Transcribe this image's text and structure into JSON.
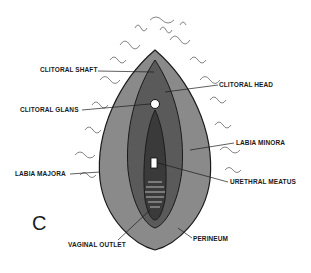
{
  "panel": "C",
  "labels": {
    "clitoral_shaft": "CLITORAL SHAFT",
    "clitoral_head": "CLITORAL HEAD",
    "clitoral_glans": "CLITORAL GLANS",
    "labia_minora": "LABIA MINORA",
    "labia_majora": "LABIA MAJORA",
    "urethral_meatus": "URETHRAL MEATUS",
    "vaginal_outlet": "VAGINAL OUTLET",
    "perineum": "PERINEUM"
  },
  "colors": {
    "ink": "#1a1a1a",
    "shade": "#555555",
    "background": "#ffffff"
  }
}
